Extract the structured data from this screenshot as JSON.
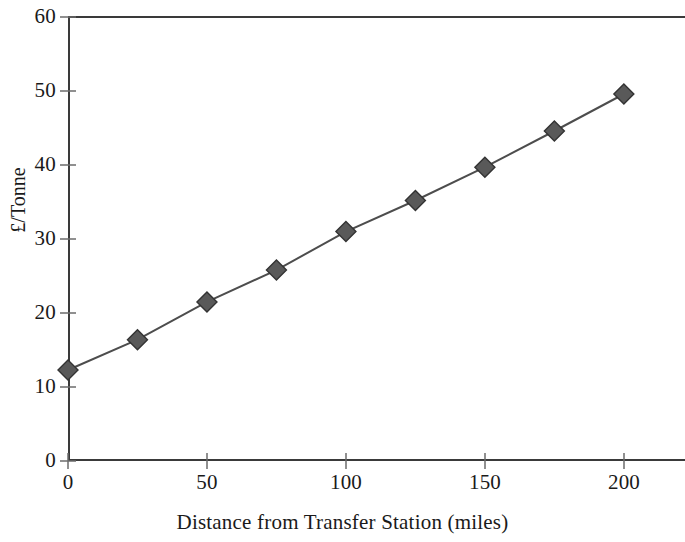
{
  "chart_data": {
    "type": "line",
    "title": "",
    "xlabel": "Distance from Transfer Station (miles)",
    "ylabel": "£/Tonne",
    "x": [
      0,
      25,
      50,
      75,
      100,
      125,
      150,
      175,
      200
    ],
    "values": [
      12.3,
      16.4,
      21.5,
      25.8,
      31.0,
      35.2,
      39.7,
      44.6,
      49.6
    ],
    "series": [
      {
        "name": "",
        "x": [
          0,
          25,
          50,
          75,
          100,
          125,
          150,
          175,
          200
        ],
        "values": [
          12.3,
          16.4,
          21.5,
          25.8,
          31.0,
          35.2,
          39.7,
          44.6,
          49.6
        ]
      }
    ],
    "xlim": [
      0,
      222
    ],
    "ylim": [
      0,
      60
    ],
    "xticks": [
      0,
      50,
      100,
      150,
      200
    ],
    "xtick_labels": [
      "0",
      "50",
      "100",
      "150",
      "200"
    ],
    "yticks": [
      0,
      10,
      20,
      30,
      40,
      50,
      60
    ],
    "ytick_labels": [
      "0",
      "10",
      "20",
      "30",
      "40",
      "50",
      "60"
    ],
    "grid": false,
    "legend": false,
    "legend_position": "none",
    "marker": "diamond",
    "line_color": "#4d4d4d",
    "marker_color": "#595959",
    "marker_edge_color": "#333333",
    "axis_color": "#3a3a3a",
    "background_color": "#ffffff"
  }
}
